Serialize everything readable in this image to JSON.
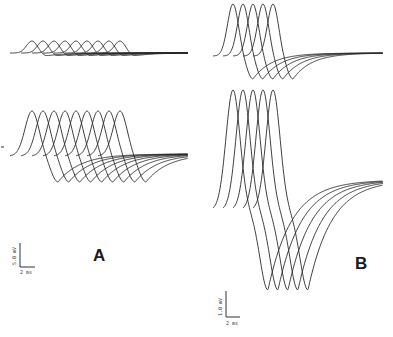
{
  "figure": {
    "panels": [
      {
        "label": "A",
        "scale_bar": {
          "vertical": "5.0 mV",
          "horizontal": "2 ms"
        },
        "rows": [
          {
            "position": "top",
            "trace_count": 9,
            "description": "small monophasic/biphasic waveforms, staggered in time"
          },
          {
            "position": "bottom",
            "trace_count": 9,
            "description": "larger biphasic waveforms with positive peak then negative trough, staggered in time"
          }
        ]
      },
      {
        "label": "B",
        "scale_bar": {
          "vertical": "1.0 mV",
          "horizontal": "2 ms"
        },
        "rows": [
          {
            "position": "top",
            "trace_count": 5,
            "description": "biphasic waveforms, staggered in time"
          },
          {
            "position": "bottom",
            "trace_count": 5,
            "description": "large biphasic waveforms with tall positive peak and deep negative trough"
          }
        ]
      }
    ]
  },
  "colors": {
    "trace": "#2a2a2a",
    "background": "#ffffff"
  }
}
